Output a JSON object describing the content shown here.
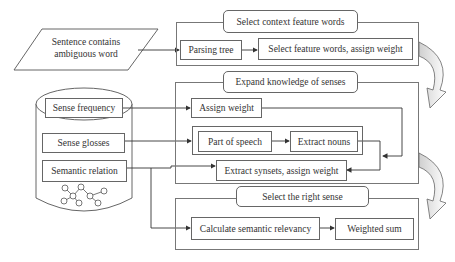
{
  "input": {
    "line1": "Sentence contains",
    "line2": "ambiguous word"
  },
  "database": {
    "items": [
      {
        "label": "Sense frequency"
      },
      {
        "label": "Sense glosses"
      },
      {
        "label": "Semantic relation"
      }
    ]
  },
  "panels": [
    {
      "title": "Select context feature words",
      "steps": [
        {
          "label": "Parsing tree"
        },
        {
          "label": "Select feature words, assign weight"
        }
      ]
    },
    {
      "title": "Expand knowledge of senses",
      "steps": [
        {
          "label": "Assign weight"
        },
        {
          "label": "Part of speech"
        },
        {
          "label": "Extract nouns"
        },
        {
          "label": "Extract synsets, assign weight"
        }
      ]
    },
    {
      "title": "Select the right sense",
      "steps": [
        {
          "label": "Calculate semantic relevancy"
        },
        {
          "label": "Weighted sum"
        }
      ]
    }
  ],
  "colors": {
    "line": "#444444",
    "border": "#666666",
    "curved_arrow_fill": "#d9d9d9"
  }
}
